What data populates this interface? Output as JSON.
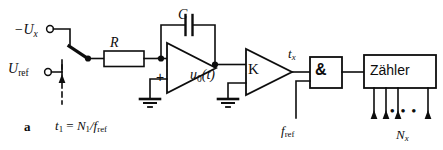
{
  "figure": {
    "caption_letter": "a",
    "caption_formula": "t₁ = N₁/f_ref",
    "language": "de",
    "type": "dual-slope-integrating-adc-block-diagram",
    "line_color": "#0d0d0d",
    "background_color": "#ffffff"
  },
  "inputs": {
    "signal": {
      "label_main": "−U",
      "label_sub": "x",
      "terminal": "open-circle"
    },
    "reference": {
      "label_main": "U",
      "label_sub": "ref",
      "terminal": "open-circle"
    }
  },
  "switch": {
    "name": "input-selector-switch",
    "control_line": "dashed",
    "control_arrow": "up",
    "timing_label_prefix": "t",
    "timing_label_sub": "1",
    "timing_label_equals": " = ",
    "timing_label_num": "N",
    "timing_label_num_sub": "1",
    "timing_label_den": "/f",
    "timing_label_den_sub": "ref"
  },
  "components": {
    "resistor": {
      "label": "R",
      "shape": "rectangle"
    },
    "capacitor": {
      "label": "C",
      "shape": "parallel-plates"
    },
    "opamp": {
      "label_inverting": "−",
      "label_noninverting": "+",
      "output_label_main": "u",
      "output_label_sub": "0",
      "output_label_arg": "(t)"
    },
    "comparator": {
      "label": "K",
      "shape": "triangle"
    },
    "and_gate": {
      "label": "&",
      "shape": "rectangle"
    },
    "counter": {
      "label": "Zähler",
      "shape": "rectangle"
    }
  },
  "signals": {
    "tx_main": "t",
    "tx_sub": "x",
    "fref_main": "f",
    "fref_sub": "ref",
    "nx_main": "N",
    "nx_sub": "x",
    "output_ellipsis": "• • •",
    "output_arrow_count": 4
  },
  "grounds": [
    {
      "name": "ground-opamp-noninverting"
    },
    {
      "name": "ground-comparator-lower-input"
    }
  ]
}
